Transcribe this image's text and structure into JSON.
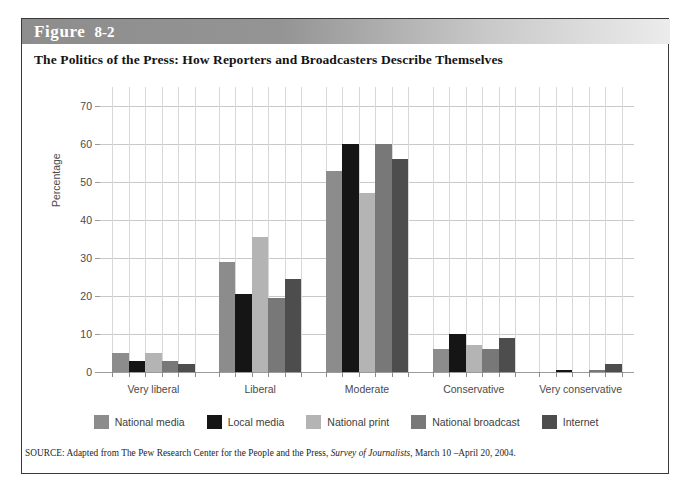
{
  "figure": {
    "header_word": "Figure",
    "header_number": "8-2",
    "title": "The Politics of the Press: How Reporters and Broadcasters Describe Themselves",
    "source_prefix": "SOURCE: Adapted from The Pew Research Center for the People and the Press, ",
    "source_italic": "Survey of Journalists",
    "source_suffix": ", March 10 –April 20, 2004."
  },
  "colors": {
    "national_media": "#8c8c8c",
    "local_media": "#151515",
    "national_print": "#b4b4b4",
    "national_broadcast": "#787878",
    "internet": "#4d4d4d",
    "grid": "#c9c9c9",
    "axis": "#9a9a9a",
    "header_band": "#8d8d8d",
    "text": "#4a4a4a"
  },
  "chart_data": {
    "type": "bar",
    "title": "The Politics of the Press: How Reporters and Broadcasters Describe Themselves",
    "xlabel": "",
    "ylabel": "Percentage",
    "ylim": [
      0,
      75
    ],
    "yticks": [
      0,
      10,
      20,
      30,
      40,
      50,
      60,
      70
    ],
    "ytick_labels": [
      "0",
      "10",
      "20",
      "30",
      "40",
      "50",
      "60",
      "70"
    ],
    "grid": true,
    "legend_position": "bottom",
    "categories": [
      "Very liberal",
      "Liberal",
      "Moderate",
      "Conservative",
      "Very conservative"
    ],
    "series": [
      {
        "name": "National media",
        "color": "#8c8c8c",
        "values": [
          5,
          29,
          53,
          6,
          0
        ]
      },
      {
        "name": "Local media",
        "color": "#151515",
        "values": [
          3,
          20.5,
          60,
          10,
          0.5
        ]
      },
      {
        "name": "National print",
        "color": "#b4b4b4",
        "values": [
          5,
          35.5,
          47,
          7,
          0
        ]
      },
      {
        "name": "National broadcast",
        "color": "#787878",
        "values": [
          3,
          19.5,
          60,
          6,
          0.5
        ]
      },
      {
        "name": "Internet",
        "color": "#4d4d4d",
        "values": [
          2,
          24.5,
          56,
          9,
          2
        ]
      }
    ]
  }
}
